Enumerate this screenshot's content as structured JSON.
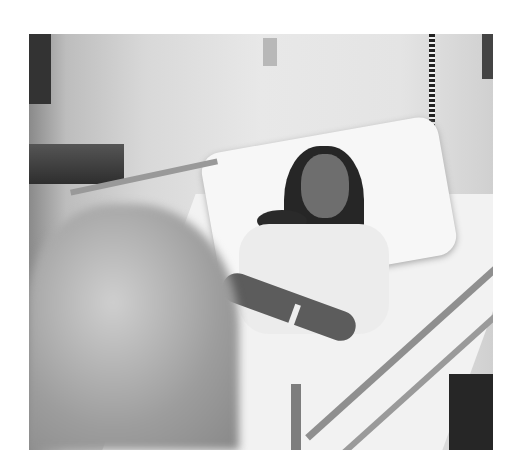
{
  "image": {
    "description": "Black and white photograph of a woman resting in a hospital bed with eyes closed, wearing a hospital gown and wristband, with metal bed rails in the foreground and a blurred figure at lower left",
    "style": "grayscale photograph",
    "colors": {
      "wall": "#e6e6e6",
      "sheet": "#f4f4f4",
      "hair": "#2a2a2a",
      "rail": "#9a9a9a",
      "shadow": "#4a4a4a"
    }
  }
}
